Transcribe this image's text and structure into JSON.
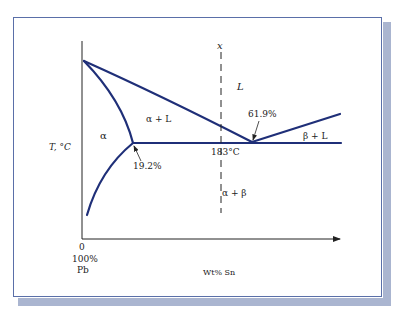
{
  "figure": {
    "y_axis_label": "T, °C",
    "x_axis_label": "Wt% Sn",
    "origin_labels": [
      "0",
      "100%",
      "Pb"
    ],
    "composition_marker": "x",
    "regions": {
      "liquid": "L",
      "alpha": "α",
      "alpha_plus_liquid": "α + L",
      "beta_plus_liquid": "β + L",
      "alpha_plus_beta": "α + β"
    },
    "annotations": {
      "alpha_solubility_limit": "19.2%",
      "eutectic_composition": "61.9%",
      "eutectic_temperature": "183°C"
    }
  },
  "colors": {
    "phase_line": "#1f2f78",
    "axis": "#222222",
    "card_border": "#5a6fa8",
    "card_shadow": "#aab5d0"
  }
}
